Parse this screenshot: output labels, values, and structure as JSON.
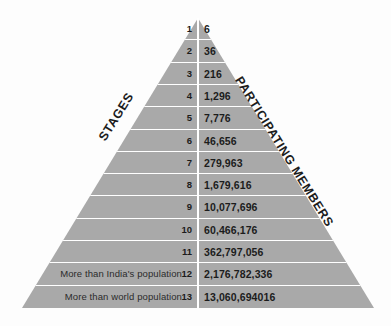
{
  "diagram": {
    "type": "pyramid",
    "title": "",
    "axis_labels": {
      "left": "STAGES",
      "right": "PARTICIPATING MEMBERS"
    },
    "columns": {
      "stage": "STAGES",
      "members": "PARTICIPATING MEMBERS"
    },
    "rows": [
      {
        "stage": "1",
        "members": "6",
        "note": ""
      },
      {
        "stage": "2",
        "members": "36",
        "note": ""
      },
      {
        "stage": "3",
        "members": "216",
        "note": ""
      },
      {
        "stage": "4",
        "members": "1,296",
        "note": ""
      },
      {
        "stage": "5",
        "members": "7,776",
        "note": ""
      },
      {
        "stage": "6",
        "members": "46,656",
        "note": ""
      },
      {
        "stage": "7",
        "members": "279,963",
        "note": ""
      },
      {
        "stage": "8",
        "members": "1,679,616",
        "note": ""
      },
      {
        "stage": "9",
        "members": "10,077,696",
        "note": ""
      },
      {
        "stage": "10",
        "members": "60,466,176",
        "note": ""
      },
      {
        "stage": "11",
        "members": "362,797,056",
        "note": ""
      },
      {
        "stage": "12",
        "members": "2,176,782,336",
        "note": "More than India's population"
      },
      {
        "stage": "13",
        "members": "13,060,694016",
        "note": "More than world population"
      }
    ]
  },
  "colors": {
    "pyramid_fill": "#a9a9a9",
    "separator": "#ffffff",
    "text": "#1c1c1c",
    "background": "#fdfdfd"
  }
}
